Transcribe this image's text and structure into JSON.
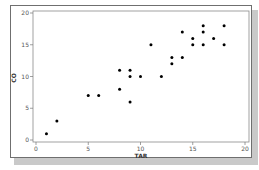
{
  "chart_data": {
    "type": "scatter",
    "title": "",
    "xlabel": "TAR",
    "ylabel": "CO",
    "xlim": [
      0,
      20
    ],
    "ylim": [
      0,
      20
    ],
    "xticks": [
      0,
      5,
      10,
      15,
      20
    ],
    "yticks": [
      0,
      5,
      10,
      15,
      20
    ],
    "grid": false,
    "legend": null,
    "marker_color": "#000000",
    "points": [
      {
        "x": 1,
        "y": 1
      },
      {
        "x": 2,
        "y": 3
      },
      {
        "x": 5,
        "y": 7
      },
      {
        "x": 6,
        "y": 7
      },
      {
        "x": 8,
        "y": 11
      },
      {
        "x": 8,
        "y": 8
      },
      {
        "x": 9,
        "y": 11
      },
      {
        "x": 9,
        "y": 10
      },
      {
        "x": 9,
        "y": 6
      },
      {
        "x": 10,
        "y": 10
      },
      {
        "x": 12,
        "y": 10
      },
      {
        "x": 11,
        "y": 15
      },
      {
        "x": 13,
        "y": 12
      },
      {
        "x": 13,
        "y": 13
      },
      {
        "x": 14,
        "y": 13
      },
      {
        "x": 14,
        "y": 17
      },
      {
        "x": 15,
        "y": 15
      },
      {
        "x": 15,
        "y": 16
      },
      {
        "x": 16,
        "y": 15
      },
      {
        "x": 16,
        "y": 17
      },
      {
        "x": 16,
        "y": 18
      },
      {
        "x": 17,
        "y": 16
      },
      {
        "x": 18,
        "y": 15
      },
      {
        "x": 18,
        "y": 18
      }
    ]
  },
  "labels": {
    "x_axis_title": "TAR",
    "y_axis_title": "CO",
    "x_tick_labels": [
      "0",
      "5",
      "10",
      "15",
      "20"
    ],
    "y_tick_labels": [
      "0",
      "5",
      "10",
      "15",
      "20"
    ]
  }
}
